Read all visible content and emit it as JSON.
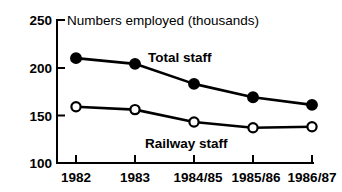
{
  "chart_data": {
    "type": "line",
    "title": "Numbers employed (thousands)",
    "xlabel": "",
    "ylabel": "",
    "categories": [
      "1982",
      "1983",
      "1984/85",
      "1985/86",
      "1986/87"
    ],
    "series": [
      {
        "name": "Total staff",
        "marker": "filled-circle",
        "values": [
          210,
          204,
          183,
          169,
          161
        ]
      },
      {
        "name": "Railway staff",
        "marker": "open-circle",
        "values": [
          159,
          156,
          143,
          137,
          138
        ]
      }
    ],
    "ylim": [
      100,
      250
    ],
    "yticks": [
      100,
      150,
      200,
      250
    ],
    "ytick_labels": [
      "100",
      "150",
      "200",
      "250"
    ],
    "grid": false,
    "legend": "inline-annotations",
    "annotations": [
      {
        "text": "Total staff",
        "series": "Total staff"
      },
      {
        "text": "Railway staff",
        "series": "Railway staff"
      }
    ],
    "colors": {
      "axis": "#000000",
      "line": "#000000",
      "marker_fill_total": "#000000",
      "marker_fill_railway": "#ffffff",
      "background": "#ffffff"
    }
  }
}
